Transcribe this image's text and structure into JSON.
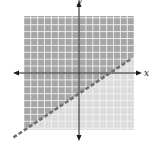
{
  "chart_data": {
    "type": "inequality-graph",
    "title": "",
    "xlabel": "x",
    "ylabel": "y",
    "xlim": [
      -8,
      8
    ],
    "ylim": [
      -8,
      8
    ],
    "grid": true,
    "grid_step": 1,
    "boundary_line": {
      "style": "dashed",
      "slope": 0.6667,
      "y_intercept": -3,
      "x_intercept": 4.5,
      "equation": "y = (2/3)x - 3"
    },
    "shaded_region": "above",
    "inequality": "y > (2/3)x - 3"
  },
  "labels": {
    "x_axis": "x",
    "y_axis": "y"
  },
  "colors": {
    "shaded": "#a6a6a6",
    "unshaded": "#dcdcdc",
    "grid_line": "#f2f2f2",
    "axis": "#1a1a1a",
    "boundary": "#707070"
  },
  "layout": {
    "origin_px": [
      79,
      73
    ],
    "unit_px": 6.9,
    "grid_left": 24,
    "grid_top": 16,
    "grid_right": 134,
    "grid_bottom": 130
  }
}
